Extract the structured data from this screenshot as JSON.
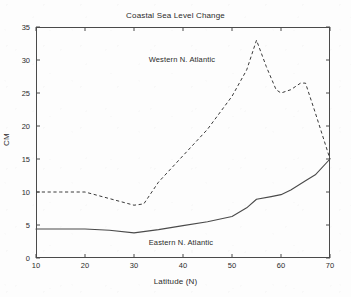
{
  "chart_data": {
    "type": "line",
    "title": "Coastal Sea Level Change",
    "xlabel": "Latitude (N)",
    "ylabel": "CM",
    "xlim": [
      10,
      70
    ],
    "ylim": [
      0,
      35
    ],
    "xticks": [
      10,
      20,
      30,
      40,
      50,
      60,
      70
    ],
    "yticks": [
      0,
      5,
      10,
      15,
      20,
      25,
      30,
      35
    ],
    "grid": false,
    "legend_position": "none",
    "annotations": [
      {
        "text": "Western N. Atlantic",
        "x": 33,
        "y": 30
      },
      {
        "text": "Eastern N. Atlantic",
        "x": 33,
        "y": 2.2
      }
    ],
    "series": [
      {
        "name": "Western N. Atlantic",
        "style": "dashed",
        "color": "#3a3a3a",
        "x": [
          10,
          15,
          20,
          25,
          30,
          32,
          35,
          40,
          45,
          50,
          53,
          55,
          57,
          59,
          60,
          62,
          64,
          65,
          67,
          70
        ],
        "values": [
          10.0,
          10.0,
          10.0,
          9.0,
          8.0,
          8.2,
          11.5,
          15.5,
          19.5,
          24.5,
          28.5,
          33.0,
          29.0,
          25.5,
          25.0,
          25.5,
          26.5,
          26.5,
          22.0,
          15.0
        ]
      },
      {
        "name": "Eastern N. Atlantic",
        "style": "solid",
        "color": "#4a4a4a",
        "x": [
          10,
          15,
          20,
          25,
          30,
          35,
          40,
          45,
          50,
          53,
          55,
          58,
          60,
          62,
          65,
          67,
          70
        ],
        "values": [
          4.4,
          4.4,
          4.4,
          4.2,
          3.8,
          4.3,
          4.9,
          5.5,
          6.3,
          7.6,
          8.9,
          9.3,
          9.6,
          10.3,
          11.7,
          12.6,
          15.0
        ]
      }
    ]
  },
  "axis": {
    "ytick_labels": [
      "0",
      "5",
      "10",
      "15",
      "20",
      "25",
      "30",
      "35"
    ],
    "xtick_labels": [
      "10",
      "20",
      "30",
      "40",
      "50",
      "60",
      "70"
    ]
  }
}
